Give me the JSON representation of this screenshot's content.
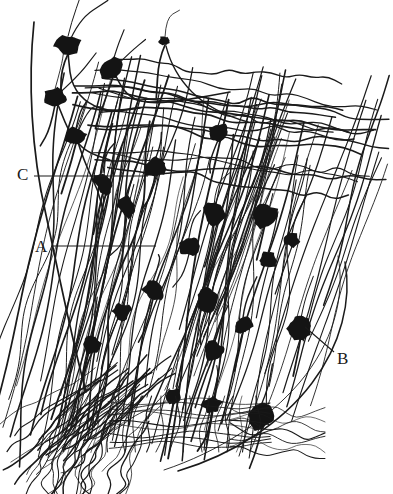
{
  "figure": {
    "kind": "histological-line-drawing",
    "background_color": "#ffffff",
    "ink_color": "#1a1a1a",
    "width": 393,
    "height": 494
  },
  "labels": [
    {
      "id": "A",
      "text": "A",
      "x": 35,
      "y": 238,
      "leader": {
        "type": "horizontal",
        "x1": 52,
        "y1": 246,
        "x2": 156,
        "y2": 246
      }
    },
    {
      "id": "B",
      "text": "B",
      "x": 337,
      "y": 350,
      "leader": {
        "type": "diagonal",
        "x1": 334,
        "y1": 352,
        "x2": 305,
        "y2": 327
      }
    },
    {
      "id": "C",
      "text": "C",
      "x": 17,
      "y": 166,
      "leader": {
        "type": "horizontal",
        "x1": 34,
        "y1": 176,
        "x2": 148,
        "y2": 176
      }
    }
  ],
  "chart_data": {
    "type": "scatter",
    "title": "",
    "xlabel": "",
    "ylabel": "",
    "annotations": [
      "A",
      "B",
      "C"
    ],
    "soma_count": 24,
    "somata": [
      {
        "x": 68,
        "y": 45,
        "rx": 13,
        "ry": 11,
        "rot": -20
      },
      {
        "x": 55,
        "y": 97,
        "rx": 12,
        "ry": 10,
        "rot": -15
      },
      {
        "x": 113,
        "y": 69,
        "rx": 12,
        "ry": 10,
        "rot": -25
      },
      {
        "x": 76,
        "y": 136,
        "rx": 10,
        "ry": 9,
        "rot": -10
      },
      {
        "x": 165,
        "y": 41,
        "rx": 6,
        "ry": 5,
        "rot": 0
      },
      {
        "x": 103,
        "y": 182,
        "rx": 9,
        "ry": 12,
        "rot": -18
      },
      {
        "x": 155,
        "y": 168,
        "rx": 12,
        "ry": 10,
        "rot": -25
      },
      {
        "x": 218,
        "y": 133,
        "rx": 10,
        "ry": 9,
        "rot": -20
      },
      {
        "x": 127,
        "y": 207,
        "rx": 9,
        "ry": 11,
        "rot": -15
      },
      {
        "x": 189,
        "y": 246,
        "rx": 11,
        "ry": 10,
        "rot": -30
      },
      {
        "x": 214,
        "y": 215,
        "rx": 10,
        "ry": 12,
        "rot": -20
      },
      {
        "x": 265,
        "y": 215,
        "rx": 13,
        "ry": 12,
        "rot": -25
      },
      {
        "x": 268,
        "y": 260,
        "rx": 10,
        "ry": 9,
        "rot": -20
      },
      {
        "x": 153,
        "y": 290,
        "rx": 10,
        "ry": 11,
        "rot": -15
      },
      {
        "x": 122,
        "y": 312,
        "rx": 9,
        "ry": 10,
        "rot": -12
      },
      {
        "x": 207,
        "y": 300,
        "rx": 11,
        "ry": 12,
        "rot": -22
      },
      {
        "x": 301,
        "y": 327,
        "rx": 14,
        "ry": 11,
        "rot": -20
      },
      {
        "x": 213,
        "y": 350,
        "rx": 10,
        "ry": 9,
        "rot": -18
      },
      {
        "x": 92,
        "y": 345,
        "rx": 9,
        "ry": 10,
        "rot": -10
      },
      {
        "x": 173,
        "y": 396,
        "rx": 10,
        "ry": 9,
        "rot": -20
      },
      {
        "x": 262,
        "y": 415,
        "rx": 13,
        "ry": 15,
        "rot": -12
      },
      {
        "x": 212,
        "y": 405,
        "rx": 10,
        "ry": 8,
        "rot": -15
      },
      {
        "x": 243,
        "y": 325,
        "rx": 9,
        "ry": 9,
        "rot": -25
      },
      {
        "x": 292,
        "y": 240,
        "rx": 8,
        "ry": 8,
        "rot": -20
      }
    ]
  }
}
